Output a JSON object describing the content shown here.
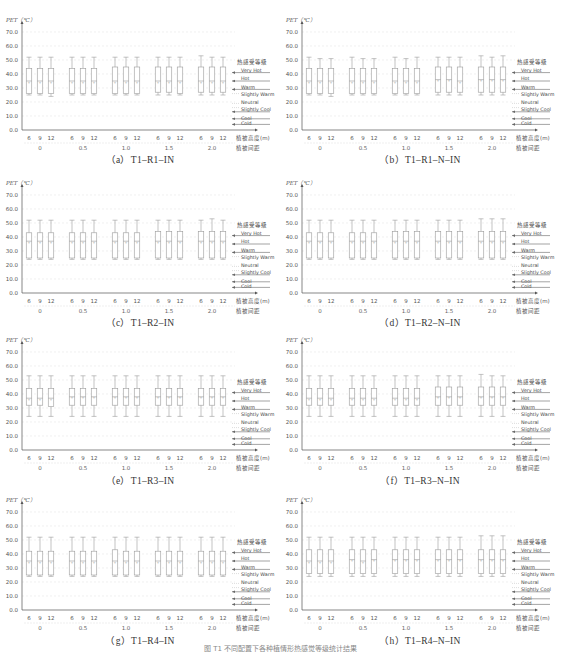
{
  "figure": {
    "caption_partial": "图 T1 不同配置下各种植情形热感觉等级统计结果"
  },
  "common": {
    "y_axis_label": "PET（℃）",
    "y_ticks": [
      "70.0",
      "60.0",
      "50.0",
      "40.0",
      "30.0",
      "20.0",
      "10.0",
      "0.0"
    ],
    "x_inner_ticks": [
      "6",
      "9",
      "12"
    ],
    "x_outer_ticks": [
      "0",
      "0.5",
      "1.0",
      "1.5",
      "2.0"
    ],
    "x_inner_label": "植被高度(m)",
    "x_outer_label": "植被间距",
    "legend_title": "热感受等级",
    "legend_items": [
      "Very Hot",
      "Hot",
      "Warm",
      "Slightly Warm",
      "Neutral",
      "Slightly Cool",
      "Cool",
      "Cold"
    ],
    "colors": {
      "box": "#9a9a9a",
      "axis": "#555555",
      "grid": "#e6e6e6",
      "legend_line": "#666666"
    }
  },
  "panels": [
    {
      "id": "a",
      "caption": "（a）T1–R1–IN"
    },
    {
      "id": "b",
      "caption": "（b）T1–R1–N–IN"
    },
    {
      "id": "c",
      "caption": "（c）T1–R2–IN"
    },
    {
      "id": "d",
      "caption": "（d）T1–R2–N–IN"
    },
    {
      "id": "e",
      "caption": "（e）T1–R3–IN"
    },
    {
      "id": "f",
      "caption": "（f）T1–R3–N–IN"
    },
    {
      "id": "g",
      "caption": "（g）T1–R4–IN"
    },
    {
      "id": "h",
      "caption": "（h）T1–R4–N–IN"
    }
  ],
  "chart_data": [
    {
      "type": "box",
      "title": "(a) T1-R1-IN",
      "ylabel": "PET (℃)",
      "ylim": [
        0,
        70
      ],
      "grid": true,
      "legend_position": "right",
      "categories": [
        "0/6",
        "0/9",
        "0/12",
        "0.5/6",
        "0.5/9",
        "0.5/12",
        "1.0/6",
        "1.0/9",
        "1.0/12",
        "1.5/6",
        "1.5/9",
        "1.5/12",
        "2.0/6",
        "2.0/9",
        "2.0/12"
      ],
      "min": [
        25,
        25,
        24,
        25,
        25,
        25,
        25,
        25,
        25,
        25,
        25,
        25,
        25,
        25,
        25
      ],
      "q1": [
        26,
        26,
        26,
        26,
        26,
        26,
        26,
        26,
        26,
        27,
        27,
        26,
        27,
        27,
        27
      ],
      "median": [
        35,
        35,
        35,
        35,
        35,
        35,
        35,
        35,
        35,
        35,
        35,
        35,
        35,
        35,
        35
      ],
      "q3": [
        44,
        44,
        44,
        44,
        44,
        44,
        45,
        45,
        45,
        45,
        45,
        45,
        45,
        45,
        45
      ],
      "max": [
        52,
        52,
        52,
        52,
        52,
        52,
        52,
        52,
        52,
        52,
        52,
        52,
        53,
        52,
        52
      ]
    },
    {
      "type": "box",
      "title": "(b) T1-R1-N-IN",
      "ylabel": "PET (℃)",
      "ylim": [
        0,
        70
      ],
      "grid": true,
      "legend_position": "right",
      "categories": [
        "0/6",
        "0/9",
        "0/12",
        "0.5/6",
        "0.5/9",
        "0.5/12",
        "1.0/6",
        "1.0/9",
        "1.0/12",
        "1.5/6",
        "1.5/9",
        "1.5/12",
        "2.0/6",
        "2.0/9",
        "2.0/12"
      ],
      "min": [
        25,
        25,
        24,
        25,
        25,
        25,
        25,
        25,
        25,
        25,
        25,
        25,
        25,
        25,
        25
      ],
      "q1": [
        26,
        26,
        26,
        26,
        26,
        26,
        26,
        26,
        26,
        27,
        27,
        27,
        27,
        27,
        27
      ],
      "median": [
        35,
        35,
        35,
        35,
        35,
        35,
        35,
        35,
        35,
        36,
        36,
        35,
        36,
        36,
        36
      ],
      "q3": [
        44,
        44,
        44,
        44,
        44,
        44,
        44,
        44,
        44,
        45,
        45,
        45,
        45,
        45,
        45
      ],
      "max": [
        52,
        51,
        51,
        52,
        51,
        51,
        52,
        51,
        52,
        52,
        52,
        52,
        53,
        52,
        53
      ]
    },
    {
      "type": "box",
      "title": "(c) T1-R2-IN",
      "ylabel": "PET (℃)",
      "ylim": [
        0,
        70
      ],
      "grid": true,
      "legend_position": "right",
      "categories": [
        "0/6",
        "0/9",
        "0/12",
        "0.5/6",
        "0.5/9",
        "0.5/12",
        "1.0/6",
        "1.0/9",
        "1.0/12",
        "1.5/6",
        "1.5/9",
        "1.5/12",
        "2.0/6",
        "2.0/9",
        "2.0/12"
      ],
      "min": [
        24,
        24,
        24,
        24,
        24,
        24,
        24,
        24,
        24,
        24,
        24,
        24,
        24,
        24,
        24
      ],
      "q1": [
        25,
        25,
        25,
        25,
        25,
        25,
        25,
        25,
        25,
        25,
        25,
        25,
        25,
        25,
        25
      ],
      "median": [
        37,
        37,
        37,
        37,
        37,
        37,
        37,
        37,
        37,
        37,
        37,
        37,
        37,
        37,
        37
      ],
      "q3": [
        43,
        43,
        43,
        43,
        43,
        43,
        43,
        43,
        43,
        44,
        44,
        44,
        44,
        44,
        44
      ],
      "max": [
        52,
        52,
        52,
        52,
        52,
        52,
        52,
        52,
        52,
        52,
        52,
        52,
        52,
        53,
        52
      ]
    },
    {
      "type": "box",
      "title": "(d) T1-R2-N-IN",
      "ylabel": "PET (℃)",
      "ylim": [
        0,
        70
      ],
      "grid": true,
      "legend_position": "right",
      "categories": [
        "0/6",
        "0/9",
        "0/12",
        "0.5/6",
        "0.5/9",
        "0.5/12",
        "1.0/6",
        "1.0/9",
        "1.0/12",
        "1.5/6",
        "1.5/9",
        "1.5/12",
        "2.0/6",
        "2.0/9",
        "2.0/12"
      ],
      "min": [
        24,
        24,
        24,
        24,
        24,
        24,
        24,
        24,
        24,
        24,
        24,
        24,
        24,
        24,
        24
      ],
      "q1": [
        25,
        25,
        25,
        25,
        25,
        25,
        25,
        25,
        25,
        25,
        25,
        25,
        25,
        25,
        25
      ],
      "median": [
        37,
        37,
        37,
        37,
        37,
        37,
        37,
        37,
        37,
        37,
        37,
        37,
        37,
        37,
        37
      ],
      "q3": [
        43,
        43,
        43,
        43,
        43,
        43,
        44,
        44,
        44,
        44,
        44,
        44,
        44,
        44,
        44
      ],
      "max": [
        52,
        52,
        52,
        52,
        52,
        52,
        52,
        52,
        52,
        52,
        52,
        52,
        53,
        53,
        53
      ]
    },
    {
      "type": "box",
      "title": "(e) T1-R3-IN",
      "ylabel": "PET (℃)",
      "ylim": [
        0,
        70
      ],
      "grid": true,
      "legend_position": "right",
      "categories": [
        "0/6",
        "0/9",
        "0/12",
        "0.5/6",
        "0.5/9",
        "0.5/12",
        "1.0/6",
        "1.0/9",
        "1.0/12",
        "1.5/6",
        "1.5/9",
        "1.5/12",
        "2.0/6",
        "2.0/9",
        "2.0/12"
      ],
      "min": [
        24,
        24,
        24,
        24,
        24,
        24,
        24,
        24,
        24,
        24,
        24,
        24,
        24,
        24,
        24
      ],
      "q1": [
        32,
        32,
        31,
        32,
        32,
        32,
        32,
        32,
        32,
        32,
        32,
        32,
        32,
        32,
        32
      ],
      "median": [
        37,
        37,
        37,
        38,
        38,
        38,
        38,
        38,
        38,
        38,
        38,
        38,
        38,
        38,
        38
      ],
      "q3": [
        44,
        44,
        44,
        44,
        44,
        44,
        44,
        44,
        44,
        44,
        44,
        44,
        44,
        44,
        44
      ],
      "max": [
        53,
        53,
        53,
        53,
        53,
        53,
        53,
        53,
        53,
        53,
        53,
        53,
        53,
        53,
        53
      ]
    },
    {
      "type": "box",
      "title": "(f) T1-R3-N-IN",
      "ylabel": "PET (℃)",
      "ylim": [
        0,
        70
      ],
      "grid": true,
      "legend_position": "right",
      "categories": [
        "0/6",
        "0/9",
        "0/12",
        "0.5/6",
        "0.5/9",
        "0.5/12",
        "1.0/6",
        "1.0/9",
        "1.0/12",
        "1.5/6",
        "1.5/9",
        "1.5/12",
        "2.0/6",
        "2.0/9",
        "2.0/12"
      ],
      "min": [
        24,
        24,
        24,
        24,
        24,
        24,
        24,
        24,
        24,
        24,
        24,
        24,
        24,
        24,
        24
      ],
      "q1": [
        32,
        32,
        32,
        32,
        32,
        32,
        32,
        32,
        32,
        32,
        32,
        32,
        32,
        32,
        32
      ],
      "median": [
        37,
        37,
        37,
        37,
        37,
        37,
        37,
        37,
        37,
        38,
        38,
        38,
        38,
        38,
        38
      ],
      "q3": [
        44,
        44,
        44,
        44,
        44,
        44,
        44,
        44,
        44,
        45,
        45,
        45,
        45,
        45,
        45
      ],
      "max": [
        53,
        53,
        53,
        53,
        53,
        53,
        53,
        53,
        53,
        53,
        53,
        53,
        54,
        53,
        53
      ]
    },
    {
      "type": "box",
      "title": "(g) T1-R4-IN",
      "ylabel": "PET (℃)",
      "ylim": [
        0,
        70
      ],
      "grid": true,
      "legend_position": "right",
      "categories": [
        "0/6",
        "0/9",
        "0/12",
        "0.5/6",
        "0.5/9",
        "0.5/12",
        "1.0/6",
        "1.0/9",
        "1.0/12",
        "1.5/6",
        "1.5/9",
        "1.5/12",
        "2.0/6",
        "2.0/9",
        "2.0/12"
      ],
      "min": [
        24,
        24,
        24,
        24,
        24,
        24,
        24,
        24,
        24,
        24,
        24,
        24,
        24,
        24,
        24
      ],
      "q1": [
        25,
        25,
        25,
        25,
        25,
        25,
        25,
        25,
        25,
        25,
        25,
        25,
        25,
        25,
        25
      ],
      "median": [
        35,
        35,
        35,
        35,
        35,
        35,
        35,
        35,
        35,
        35,
        35,
        35,
        35,
        35,
        35
      ],
      "q3": [
        42,
        42,
        42,
        42,
        42,
        42,
        43,
        42,
        42,
        42,
        42,
        42,
        42,
        42,
        42
      ],
      "max": [
        52,
        52,
        52,
        52,
        52,
        52,
        52,
        52,
        52,
        52,
        52,
        52,
        52,
        52,
        52
      ]
    },
    {
      "type": "box",
      "title": "(h) T1-R4-N-IN",
      "ylabel": "PET (℃)",
      "ylim": [
        0,
        70
      ],
      "grid": true,
      "legend_position": "right",
      "categories": [
        "0/6",
        "0/9",
        "0/12",
        "0.5/6",
        "0.5/9",
        "0.5/12",
        "1.0/6",
        "1.0/9",
        "1.0/12",
        "1.5/6",
        "1.5/9",
        "1.5/12",
        "2.0/6",
        "2.0/9",
        "2.0/12"
      ],
      "min": [
        24,
        24,
        24,
        24,
        24,
        24,
        24,
        24,
        24,
        24,
        24,
        24,
        24,
        24,
        24
      ],
      "q1": [
        26,
        26,
        26,
        26,
        26,
        26,
        26,
        26,
        26,
        26,
        26,
        26,
        26,
        26,
        26
      ],
      "median": [
        35,
        35,
        35,
        36,
        35,
        36,
        36,
        36,
        36,
        36,
        36,
        36,
        36,
        36,
        36
      ],
      "q3": [
        43,
        43,
        43,
        43,
        43,
        43,
        43,
        43,
        43,
        43,
        43,
        43,
        43,
        43,
        43
      ],
      "max": [
        52,
        52,
        52,
        52,
        52,
        52,
        52,
        52,
        52,
        52,
        52,
        52,
        53,
        53,
        53
      ]
    }
  ]
}
